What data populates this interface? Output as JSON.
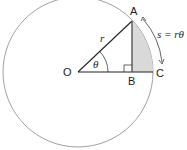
{
  "diagram": {
    "points": {
      "O": {
        "label": "O",
        "x": 78,
        "y": 72
      },
      "A": {
        "label": "A",
        "x": 132,
        "y": 21
      },
      "B": {
        "label": "B",
        "x": 132,
        "y": 72
      },
      "C": {
        "label": "C",
        "x": 153,
        "y": 72
      }
    },
    "radius_label": "r",
    "angle_label": "θ",
    "arc_label": "s = rθ",
    "colors": {
      "circle": "#888888",
      "lines": "#222222",
      "shade": "#d9d9d9",
      "vertical": "#555555"
    }
  }
}
